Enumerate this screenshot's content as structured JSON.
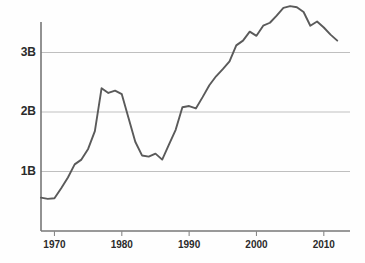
{
  "chart_data": {
    "type": "line",
    "title": "",
    "subtitle": "",
    "xlabel": "",
    "ylabel": "",
    "xlim": [
      1968,
      2013
    ],
    "ylim": [
      0,
      3.95
    ],
    "grid": true,
    "legend": null,
    "yticks": [
      1,
      2,
      3
    ],
    "ytick_labels": [
      "1B",
      "2B",
      "3B"
    ],
    "xticks": [
      1970,
      1980,
      1990,
      2000,
      2010
    ],
    "xtick_labels": [
      "1970",
      "1980",
      "1990",
      "2000",
      "2010"
    ],
    "series": [
      {
        "name": "value",
        "color": "#5a5a5a",
        "x": [
          1968,
          1969,
          1970,
          1971,
          1972,
          1973,
          1974,
          1975,
          1976,
          1977,
          1978,
          1979,
          1980,
          1981,
          1982,
          1983,
          1984,
          1985,
          1986,
          1987,
          1988,
          1989,
          1990,
          1991,
          1992,
          1993,
          1994,
          1995,
          1996,
          1997,
          1998,
          1999,
          2000,
          2001,
          2002,
          2003,
          2004,
          2005,
          2006,
          2007,
          2008,
          2009,
          2010,
          2011,
          2012
        ],
        "values": [
          0.56,
          0.54,
          0.55,
          0.72,
          0.9,
          1.12,
          1.2,
          1.38,
          1.68,
          2.4,
          2.32,
          2.36,
          2.3,
          1.9,
          1.5,
          1.27,
          1.25,
          1.3,
          1.2,
          1.45,
          1.7,
          2.08,
          2.1,
          2.06,
          2.25,
          2.45,
          2.6,
          2.72,
          2.85,
          3.12,
          3.2,
          3.35,
          3.28,
          3.45,
          3.5,
          3.62,
          3.75,
          3.78,
          3.76,
          3.68,
          3.45,
          3.52,
          3.42,
          3.3,
          3.2
        ]
      }
    ]
  },
  "axes": {
    "y_axis_name": "y-axis",
    "x_axis_name": "x-axis"
  }
}
